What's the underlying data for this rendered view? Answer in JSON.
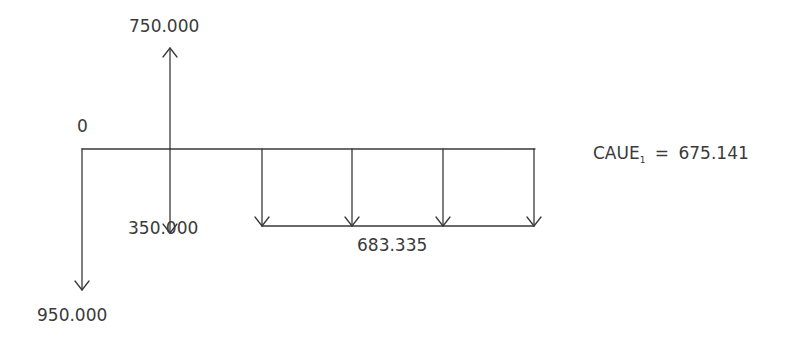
{
  "diagram": {
    "type": "cash-flow",
    "origin_label": "0",
    "inflow_top": "750.000",
    "outflow_period1": "350.000",
    "initial_outflow": "950.000",
    "annuity_value": "683.335",
    "result": {
      "name": "CAUE",
      "subscript": "1",
      "equals": "=",
      "value": "675.141"
    },
    "line_color": "#3a3a3a"
  }
}
